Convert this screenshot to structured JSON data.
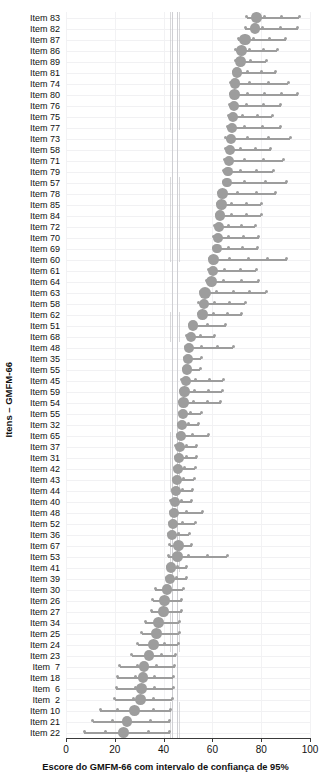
{
  "chart_data": {
    "type": "scatter",
    "title": "",
    "xlabel": "Escore do GMFM-66 com intervalo de confiança de 95%",
    "ylabel": "Itens – GMFM-66",
    "xlim": [
      0,
      100
    ],
    "xticks": [
      0,
      20,
      40,
      60,
      80,
      100
    ],
    "xticklabels": [
      "0",
      "20",
      "40",
      "60",
      "80",
      "100"
    ],
    "grid": true,
    "legend": null,
    "marker_color": "#9d9d9d",
    "line_color": "#9d9d9d",
    "reference_lines": [
      42.5,
      43.6,
      45.4,
      46.3
    ],
    "categories": [
      "Item 83",
      "Item 82",
      "Item 87",
      "Item 86",
      "Item 89",
      "Item 81",
      "Item 74",
      "Item 80",
      "Item 76",
      "Item 75",
      "Item 77",
      "Item 73",
      "Item 58",
      "Item 71",
      "Item 79",
      "Item 57",
      "Item 78",
      "Item 85",
      "Item 84",
      "Item 72",
      "Item 70",
      "Item 69",
      "Item 60",
      "Item 61",
      "Item 64",
      "Item 63",
      "Item 58",
      "Item 62",
      "Item 51",
      "Item 68",
      "Item 48",
      "Item 35",
      "Item 55",
      "Item 45",
      "Item 59",
      "Item 54",
      "Item 55",
      "Item 32",
      "Item 65",
      "Item 37",
      "Item 31",
      "Item 42",
      "Item 43",
      "Item 44",
      "Item 40",
      "Item 48",
      "Item 52",
      "Item 36",
      "Item 67",
      "Item 53",
      "Item 41",
      "Item 39",
      "Item 30",
      "Item 26",
      "Item 27",
      "Item 34",
      "Item 25",
      "Item 24",
      "Item 23",
      "Item  7",
      "Item 18",
      "Item  6",
      "Item  2",
      "Item 10",
      "Item 21",
      "Item 22"
    ],
    "values": [
      78.0,
      77.5,
      73.3,
      72.0,
      71.6,
      70.0,
      69.2,
      69.0,
      68.8,
      68.4,
      68.0,
      67.6,
      67.2,
      66.8,
      66.4,
      66.0,
      64.3,
      63.6,
      63.0,
      62.6,
      62.3,
      61.9,
      60.6,
      60.2,
      59.5,
      57.0,
      56.4,
      56.0,
      52.0,
      51.2,
      50.6,
      50.0,
      49.5,
      49.0,
      48.6,
      48.2,
      48.0,
      47.6,
      47.2,
      46.8,
      46.4,
      46.0,
      45.6,
      45.2,
      44.8,
      44.4,
      44.0,
      43.5,
      46.0,
      45.6,
      43.0,
      42.5,
      41.5,
      40.5,
      40.0,
      38.0,
      37.0,
      36.0,
      34.0,
      32.0,
      31.5,
      31.0,
      30.5,
      28.0,
      25.0,
      23.5
    ],
    "ci_low": [
      74.0,
      73.5,
      70.5,
      69.5,
      69.5,
      68.5,
      67.5,
      67.5,
      67.0,
      66.5,
      66.0,
      65.5,
      65.5,
      65.0,
      64.5,
      64.5,
      62.5,
      62.0,
      61.5,
      61.0,
      60.5,
      60.5,
      59.0,
      58.5,
      57.5,
      55.0,
      54.5,
      54.5,
      50.5,
      49.5,
      49.0,
      48.5,
      48.0,
      47.5,
      47.0,
      46.5,
      46.5,
      46.0,
      45.5,
      45.0,
      45.0,
      44.5,
      44.0,
      43.5,
      43.0,
      43.0,
      42.5,
      42.0,
      42.5,
      42.0,
      41.5,
      41.0,
      36.5,
      35.5,
      35.0,
      32.5,
      31.0,
      29.5,
      27.0,
      22.0,
      21.0,
      20.5,
      20.0,
      14.0,
      11.0,
      7.5
    ],
    "ci_high": [
      95.5,
      95.0,
      90.0,
      86.5,
      82.0,
      86.0,
      91.0,
      95.0,
      88.0,
      84.5,
      88.0,
      92.0,
      84.0,
      89.0,
      85.0,
      90.5,
      86.0,
      80.0,
      80.0,
      77.5,
      79.0,
      78.5,
      90.5,
      78.0,
      79.0,
      82.0,
      73.5,
      72.0,
      65.5,
      61.0,
      68.5,
      55.5,
      55.0,
      64.5,
      64.0,
      63.5,
      55.5,
      54.5,
      58.5,
      53.5,
      53.5,
      53.0,
      52.5,
      52.0,
      51.5,
      56.0,
      53.0,
      50.5,
      51.5,
      66.0,
      49.5,
      49.5,
      48.0,
      47.5,
      47.5,
      46.5,
      46.5,
      46.0,
      45.0,
      44.5,
      44.0,
      44.0,
      43.5,
      43.0,
      42.5,
      42.5
    ],
    "dot_sizes": [
      5.2,
      5.2,
      5.8,
      5.4,
      5.4,
      5.2,
      5.2,
      5.4,
      5.0,
      5.0,
      5.0,
      5.0,
      5.0,
      5.0,
      4.8,
      4.8,
      5.4,
      5.6,
      5.2,
      5.0,
      5.0,
      4.8,
      5.6,
      5.0,
      5.6,
      6.0,
      5.0,
      5.4,
      5.2,
      5.0,
      5.0,
      5.0,
      5.2,
      5.0,
      5.2,
      5.2,
      5.0,
      5.0,
      5.0,
      5.0,
      5.0,
      5.0,
      5.0,
      5.0,
      5.0,
      5.0,
      5.0,
      5.0,
      5.4,
      5.6,
      5.2,
      5.0,
      5.2,
      5.4,
      5.2,
      5.4,
      5.6,
      5.4,
      5.2,
      5.4,
      5.2,
      5.6,
      5.4,
      5.4,
      5.4,
      5.6
    ]
  }
}
